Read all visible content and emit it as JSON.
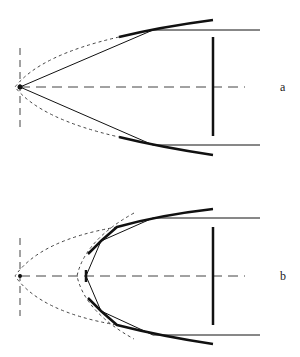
{
  "figure": {
    "panels": [
      {
        "label": "a",
        "description": "Point source at focus, rays reflected by parabolic mirror segments into parallel beam"
      },
      {
        "label": "b",
        "description": "Shifted source with second smaller parabola and faceted reflector segments"
      }
    ]
  },
  "colors": {
    "stroke": "#111111",
    "dashed": "#444444",
    "background": "#ffffff"
  }
}
